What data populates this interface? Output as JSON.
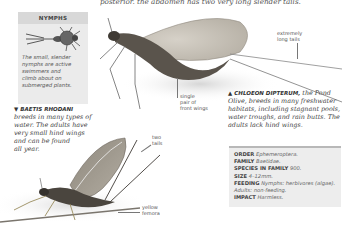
{
  "page": {
    "top_text": "posterior. the abdomen has two very long slender tails."
  },
  "nymph_box": {
    "title": "NYMPHS",
    "caption_lines": [
      "The small, slender",
      "nymphs are active",
      "swimmers and",
      "climb about on",
      "submerged plants."
    ],
    "illustration": "mayfly-nymph-illustration"
  },
  "annotations": {
    "extremely_long_tails": [
      "extremely",
      "long tails"
    ],
    "single_pair_front_wings": [
      "single",
      "pair of",
      "front wings"
    ],
    "two_tails": [
      "two",
      "tails"
    ],
    "yellow_femora": [
      "yellow",
      "femora"
    ]
  },
  "species": [
    {
      "id": "chloeon",
      "marker": "▲",
      "name": "CHLOEON DIPTERUM,",
      "lines": [
        " the Pond",
        "Olive, breeds in many freshwater",
        "habitats, including stagnant pools,",
        "water troughs, and rain butts. The",
        "adults lack hind wings."
      ]
    },
    {
      "id": "baetis",
      "marker": "▼",
      "name": "BAETIS RHODANI",
      "lines": [
        "breeds in many types of",
        "water. The adults have",
        "very small hind wings",
        "and can be found",
        "all year."
      ]
    }
  ],
  "info_box": {
    "rows": [
      {
        "key": "ORDER",
        "value": "Ephemeroptera."
      },
      {
        "key": "FAMILY",
        "value": "Baetidae."
      },
      {
        "key": "SPECIES IN FAMILY",
        "value": "900."
      },
      {
        "key": "SIZE",
        "value": "4–12mm."
      },
      {
        "key": "FEEDING",
        "value": "Nymphs: herbivores (algae)."
      },
      {
        "key": "",
        "value": "Adults: non-feeding."
      },
      {
        "key": "IMPACT",
        "value": "Harmless."
      }
    ]
  },
  "colors": {
    "box_bg": "#ebebeb",
    "box_header": "#d8d8d8",
    "info_border": "#b8b8b8",
    "wing": "#c9c4bb",
    "body_dark": "#4a453e",
    "femora_yellow": "#b9a66a"
  }
}
